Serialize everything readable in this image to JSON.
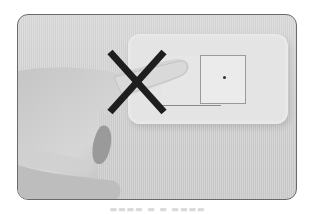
{
  "image": {
    "subject": "hand pressing a wall light switch",
    "overlay_symbol": "cross-mark",
    "colors": {
      "background": "#ffffff",
      "card_border": "#6a6a6a",
      "wall": "#d6d6d6",
      "switch_plate": "#e4e4e4",
      "cross": "#1e1e1e"
    }
  },
  "caption": {
    "text": "▬▬▬▬ ▬ ▬ ▬▬▬▬"
  }
}
